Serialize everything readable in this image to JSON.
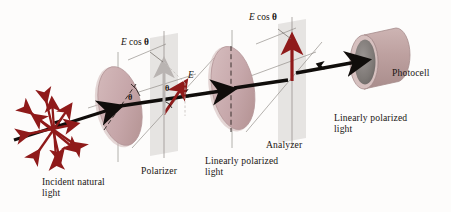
{
  "figure": {
    "background": "#fdfcfb"
  },
  "colors": {
    "disk_face": "#c9aaac",
    "disk_face_dark": "#b99a9d",
    "disk_rim": "#d8c2c3",
    "beam": "#100d0b",
    "vector_red": "#8f1a1a",
    "vector_gray": "#b9b4b2",
    "plane_gray": "#dddbd8",
    "axis_line": "#6d6762",
    "photocell_face": "#7f7a77",
    "text": "#1a1512"
  },
  "labels": {
    "incident": "Incident natural\nlight",
    "polarizer": "Polarizer",
    "linearly_polarized_1": "Linearly polarized\nlight",
    "analyzer": "Analyzer",
    "linearly_polarized_2": "Linearly polarized\nlight",
    "photocell": "Photocell"
  },
  "math": {
    "e_cos_theta_1": {
      "symbol": "E",
      "expr": "cos",
      "theta": "θ"
    },
    "e_cos_theta_2": {
      "symbol": "E",
      "expr": "cos",
      "theta": "θ"
    },
    "e_vector": "E",
    "theta_polarizer": "θ",
    "theta_vector": "θ"
  },
  "elements": {
    "incident_light": {
      "name": "unpolarized-light-starburst",
      "description": "radial double-headed arrows showing random vibration planes",
      "ray_count": 12,
      "color": "#8f1a1a"
    },
    "polarizer": {
      "name": "polarizer-disk",
      "shape": "ellipse",
      "transmission_axis": "dashed line tilted at angle theta"
    },
    "analyzer": {
      "name": "analyzer-disk",
      "shape": "ellipse",
      "transmission_axis": "vertical dashed line"
    },
    "photocell": {
      "name": "photocell-cylinder",
      "shape": "cylinder",
      "face_color": "#7f7a77"
    },
    "beam": {
      "name": "light-beam-axis",
      "direction": "left-to-right, rising",
      "arrowheads": 4
    }
  }
}
